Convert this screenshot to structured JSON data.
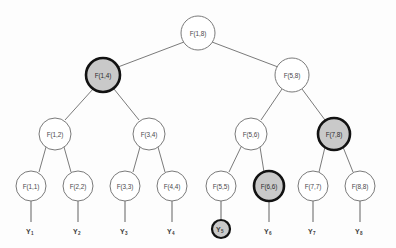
{
  "figure": {
    "colors": {
      "background": "#fdfdfd",
      "node_fill": "#ffffff",
      "node_stroke": "#7a7a7a",
      "highlight_fill": "#c9c9c9",
      "highlight_stroke": "#121212",
      "edge_stroke": "#6b6b6b",
      "label_text": "#4a4a4a"
    }
  },
  "nodes": {
    "root": {
      "label": "F(1,8)",
      "cx": 198,
      "cy": 33,
      "r": 17,
      "highlight": false
    },
    "l2": [
      {
        "label": "F(1,4)",
        "cx": 103,
        "cy": 75,
        "r": 17,
        "highlight": true
      },
      {
        "label": "F(5,8)",
        "cx": 292,
        "cy": 75,
        "r": 17,
        "highlight": false
      }
    ],
    "l3": [
      {
        "label": "F(1,2)",
        "cx": 55,
        "cy": 134,
        "r": 16,
        "highlight": false
      },
      {
        "label": "F(3,4)",
        "cx": 149,
        "cy": 134,
        "r": 16,
        "highlight": false
      },
      {
        "label": "F(5,6)",
        "cx": 251,
        "cy": 134,
        "r": 16,
        "highlight": false
      },
      {
        "label": "F(7,8)",
        "cx": 334,
        "cy": 134,
        "r": 16,
        "highlight": true
      }
    ],
    "leaves": [
      {
        "label": "F(1,1)",
        "cx": 31,
        "cy": 186,
        "r": 15,
        "highlight": false
      },
      {
        "label": "F(2,2)",
        "cx": 78,
        "cy": 186,
        "r": 15,
        "highlight": false
      },
      {
        "label": "F(3,3)",
        "cx": 125,
        "cy": 186,
        "r": 15,
        "highlight": false
      },
      {
        "label": "F(4,4)",
        "cx": 172,
        "cy": 186,
        "r": 15,
        "highlight": false
      },
      {
        "label": "F(5,5)",
        "cx": 221,
        "cy": 186,
        "r": 15,
        "highlight": false
      },
      {
        "label": "F(6,6)",
        "cx": 269,
        "cy": 186,
        "r": 15,
        "highlight": true
      },
      {
        "label": "F(7,7)",
        "cx": 313,
        "cy": 186,
        "r": 15,
        "highlight": false
      },
      {
        "label": "F(8,8)",
        "cx": 360,
        "cy": 186,
        "r": 15,
        "highlight": false
      }
    ],
    "observations": [
      {
        "base": "Y",
        "sub": "1",
        "cx": 31,
        "cy": 231,
        "highlight": false
      },
      {
        "base": "Y",
        "sub": "2",
        "cx": 78,
        "cy": 231,
        "highlight": false
      },
      {
        "base": "Y",
        "sub": "3",
        "cx": 125,
        "cy": 231,
        "highlight": false
      },
      {
        "base": "Y",
        "sub": "4",
        "cx": 172,
        "cy": 231,
        "highlight": false
      },
      {
        "base": "Y",
        "sub": "5",
        "cx": 221,
        "cy": 229,
        "highlight": true
      },
      {
        "base": "Y",
        "sub": "6",
        "cx": 269,
        "cy": 231,
        "highlight": false
      },
      {
        "base": "Y",
        "sub": "7",
        "cx": 313,
        "cy": 231,
        "highlight": false
      },
      {
        "base": "Y",
        "sub": "8",
        "cx": 360,
        "cy": 231,
        "highlight": false
      }
    ]
  },
  "edges": [
    {
      "from": "F(1,8)",
      "to": "F(1,4)",
      "x1": 184,
      "y1": 42,
      "x2": 118,
      "y2": 67
    },
    {
      "from": "F(1,8)",
      "to": "F(5,8)",
      "x1": 212,
      "y1": 42,
      "x2": 278,
      "y2": 67
    },
    {
      "from": "F(1,4)",
      "to": "F(1,2)",
      "x1": 93,
      "y1": 89,
      "x2": 65,
      "y2": 120
    },
    {
      "from": "F(1,4)",
      "to": "F(3,4)",
      "x1": 114,
      "y1": 89,
      "x2": 139,
      "y2": 120
    },
    {
      "from": "F(5,8)",
      "to": "F(5,6)",
      "x1": 282,
      "y1": 89,
      "x2": 261,
      "y2": 120
    },
    {
      "from": "F(5,8)",
      "to": "F(7,8)",
      "x1": 302,
      "y1": 89,
      "x2": 325,
      "y2": 120
    },
    {
      "from": "F(1,2)",
      "to": "F(1,1)",
      "x1": 46,
      "y1": 147,
      "x2": 39,
      "y2": 172
    },
    {
      "from": "F(1,2)",
      "to": "F(2,2)",
      "x1": 64,
      "y1": 147,
      "x2": 71,
      "y2": 172
    },
    {
      "from": "F(3,4)",
      "to": "F(3,3)",
      "x1": 140,
      "y1": 147,
      "x2": 133,
      "y2": 172
    },
    {
      "from": "F(3,4)",
      "to": "F(4,4)",
      "x1": 158,
      "y1": 147,
      "x2": 165,
      "y2": 172
    },
    {
      "from": "F(5,6)",
      "to": "F(5,5)",
      "x1": 241,
      "y1": 147,
      "x2": 229,
      "y2": 172
    },
    {
      "from": "F(5,6)",
      "to": "F(6,6)",
      "x1": 260,
      "y1": 147,
      "x2": 264,
      "y2": 172
    },
    {
      "from": "F(7,8)",
      "to": "F(7,7)",
      "x1": 325,
      "y1": 147,
      "x2": 319,
      "y2": 172
    },
    {
      "from": "F(7,8)",
      "to": "F(8,8)",
      "x1": 343,
      "y1": 147,
      "x2": 353,
      "y2": 172
    }
  ],
  "stems": [
    {
      "from": "F(1,1)",
      "to": "Y1",
      "x1": 31,
      "y1": 201,
      "x2": 31,
      "y2": 222
    },
    {
      "from": "F(2,2)",
      "to": "Y2",
      "x1": 78,
      "y1": 201,
      "x2": 78,
      "y2": 222
    },
    {
      "from": "F(3,3)",
      "to": "Y3",
      "x1": 125,
      "y1": 201,
      "x2": 125,
      "y2": 222
    },
    {
      "from": "F(4,4)",
      "to": "Y4",
      "x1": 172,
      "y1": 201,
      "x2": 172,
      "y2": 222
    },
    {
      "from": "F(5,5)",
      "to": "Y5",
      "x1": 221,
      "y1": 201,
      "x2": 221,
      "y2": 219
    },
    {
      "from": "F(6,6)",
      "to": "Y6",
      "x1": 269,
      "y1": 201,
      "x2": 269,
      "y2": 222
    },
    {
      "from": "F(7,7)",
      "to": "Y7",
      "x1": 313,
      "y1": 201,
      "x2": 313,
      "y2": 222
    },
    {
      "from": "F(8,8)",
      "to": "Y8",
      "x1": 360,
      "y1": 201,
      "x2": 360,
      "y2": 222
    }
  ]
}
